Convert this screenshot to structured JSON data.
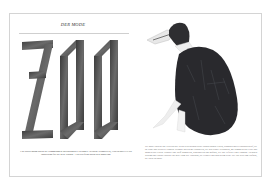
{
  "spread": {
    "left_page": {
      "kicker": "DER MODE",
      "headline": "ZOO",
      "caption": "Ein Spaziergang durch die Sammlungen internationaler Designer: tierische Silhouetten, Federn und Fell als Inspiration für die neue Saison – ein Streifzug durch den Modezoo."
    },
    "right_page": {
      "figure_description": "penguin-like figure in dark feathered coat",
      "body_text": "Die Mode entdeckt das Tierreich neu. In den Kollektionen dieser Saison tauchen Federn, Schuppen und Pelzstrukturen auf, die an Vögel und Wildtiere erinnern. Designer spielen mit Silhouetten, die den Körper verwandeln, mit Schnäbeln aus Leder und Mänteln aus Federn. Schwarz und Weiß dominieren, kontrastreich und grafisch, wie das Gefieder eines Pinguins. Zwischen Kostüm und Couture entsteht eine neue Form des Ausdrucks, die verspielt und doch streng wirkt. Der Zoo wird zum Laufsteg, die Natur zur Muse."
    }
  },
  "colors": {
    "border": "#d4d4d4",
    "letters": "#4a4a4a",
    "feathers": "#2b2b2e",
    "text": "#444444"
  }
}
